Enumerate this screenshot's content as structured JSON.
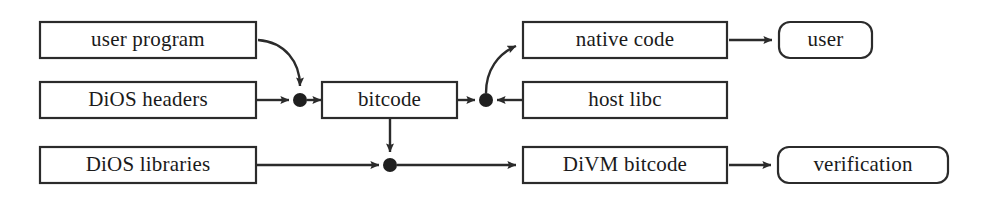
{
  "diagram": {
    "accent_color": "#2b2b2b",
    "background_color": "#ffffff",
    "nodes": [
      {
        "id": "user_program",
        "label": "user program",
        "shape": "rect",
        "x": 40,
        "y": 22,
        "w": 216,
        "h": 36
      },
      {
        "id": "dios_headers",
        "label": "DiOS headers",
        "shape": "rect",
        "x": 40,
        "y": 82,
        "w": 216,
        "h": 36
      },
      {
        "id": "dios_libraries",
        "label": "DiOS libraries",
        "shape": "rect",
        "x": 40,
        "y": 147,
        "w": 216,
        "h": 36
      },
      {
        "id": "bitcode",
        "label": "bitcode",
        "shape": "rect",
        "x": 322,
        "y": 82,
        "w": 135,
        "h": 36
      },
      {
        "id": "native_code",
        "label": "native code",
        "shape": "rect",
        "x": 523,
        "y": 22,
        "w": 204,
        "h": 36
      },
      {
        "id": "host_libc",
        "label": "host libc",
        "shape": "rect",
        "x": 523,
        "y": 82,
        "w": 204,
        "h": 36
      },
      {
        "id": "divm_bitcode",
        "label": "DiVM bitcode",
        "shape": "rect",
        "x": 523,
        "y": 147,
        "w": 204,
        "h": 36
      },
      {
        "id": "user",
        "label": "user",
        "shape": "rounded-rect",
        "x": 779,
        "y": 22,
        "w": 93,
        "h": 36
      },
      {
        "id": "verification",
        "label": "verification",
        "shape": "rounded-rect",
        "x": 778,
        "y": 147,
        "w": 170,
        "h": 36
      }
    ],
    "junctions": [
      {
        "id": "junction_bitcode_in",
        "x": 300,
        "y": 100,
        "r": 7
      },
      {
        "id": "junction_bitcode_out",
        "x": 486,
        "y": 100,
        "r": 7
      },
      {
        "id": "junction_lowering",
        "x": 390,
        "y": 165,
        "r": 7
      }
    ],
    "edges": [
      {
        "id": "edge-user-program-to-junction-in",
        "from": "user_program",
        "to": "junction_bitcode_in",
        "style": "curved",
        "arrow": true
      },
      {
        "id": "edge-dios-headers-to-junction-in",
        "from": "dios_headers",
        "to": "junction_bitcode_in",
        "style": "straight",
        "arrow": true
      },
      {
        "id": "edge-junction-in-to-bitcode",
        "from": "junction_bitcode_in",
        "to": "bitcode",
        "style": "straight",
        "arrow": true
      },
      {
        "id": "edge-bitcode-to-junction-out",
        "from": "bitcode",
        "to": "junction_bitcode_out",
        "style": "straight",
        "arrow": true
      },
      {
        "id": "edge-host-libc-to-junction-out",
        "from": "host_libc",
        "to": "junction_bitcode_out",
        "style": "straight",
        "arrow": true
      },
      {
        "id": "edge-junction-out-to-native-code",
        "from": "junction_bitcode_out",
        "to": "native_code",
        "style": "curved",
        "arrow": true
      },
      {
        "id": "edge-native-code-to-user",
        "from": "native_code",
        "to": "user",
        "style": "straight",
        "arrow": true
      },
      {
        "id": "edge-dios-libraries-to-junction-low",
        "from": "dios_libraries",
        "to": "junction_lowering",
        "style": "straight",
        "arrow": true
      },
      {
        "id": "edge-bitcode-to-junction-low",
        "from": "bitcode",
        "to": "junction_lowering",
        "style": "straight",
        "arrow": true
      },
      {
        "id": "edge-junction-low-to-divm-bitcode",
        "from": "junction_lowering",
        "to": "divm_bitcode",
        "style": "straight",
        "arrow": true
      },
      {
        "id": "edge-divm-bitcode-to-verification",
        "from": "divm_bitcode",
        "to": "verification",
        "style": "straight",
        "arrow": true
      }
    ]
  }
}
